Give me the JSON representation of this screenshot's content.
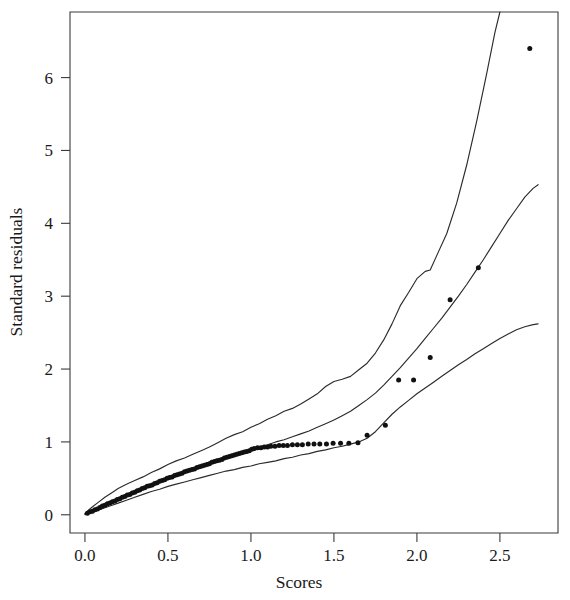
{
  "chart_data": {
    "type": "scatter",
    "title": "",
    "subtitle": "",
    "xlabel": "Scores",
    "ylabel": "Standard residuals",
    "xlim": [
      -0.09,
      2.85
    ],
    "ylim": [
      -0.25,
      6.9
    ],
    "xticks": [
      0.0,
      0.5,
      1.0,
      1.5,
      2.0,
      2.5
    ],
    "xtick_labels": [
      "0.0",
      "0.5",
      "1.0",
      "1.5",
      "2.0",
      "2.5"
    ],
    "yticks": [
      0,
      1,
      2,
      3,
      4,
      5,
      6
    ],
    "ytick_labels": [
      "0",
      "1",
      "2",
      "3",
      "4",
      "5",
      "6"
    ],
    "grid": false,
    "legend": "none",
    "point_color": "#111111",
    "line_color": "#2b2b2b",
    "frame_color": "#3a3a3a",
    "series": [
      {
        "name": "Upper envelope",
        "kind": "line",
        "points": [
          [
            0.0,
            0.02
          ],
          [
            0.04,
            0.1
          ],
          [
            0.08,
            0.17
          ],
          [
            0.12,
            0.24
          ],
          [
            0.16,
            0.3
          ],
          [
            0.2,
            0.36
          ],
          [
            0.25,
            0.42
          ],
          [
            0.3,
            0.47
          ],
          [
            0.35,
            0.52
          ],
          [
            0.4,
            0.58
          ],
          [
            0.45,
            0.63
          ],
          [
            0.5,
            0.69
          ],
          [
            0.55,
            0.74
          ],
          [
            0.6,
            0.78
          ],
          [
            0.65,
            0.83
          ],
          [
            0.7,
            0.88
          ],
          [
            0.75,
            0.93
          ],
          [
            0.8,
            0.99
          ],
          [
            0.85,
            1.05
          ],
          [
            0.9,
            1.1
          ],
          [
            0.95,
            1.14
          ],
          [
            1.0,
            1.2
          ],
          [
            1.05,
            1.25
          ],
          [
            1.1,
            1.31
          ],
          [
            1.15,
            1.36
          ],
          [
            1.2,
            1.42
          ],
          [
            1.25,
            1.46
          ],
          [
            1.3,
            1.52
          ],
          [
            1.35,
            1.59
          ],
          [
            1.4,
            1.66
          ],
          [
            1.45,
            1.76
          ],
          [
            1.5,
            1.83
          ],
          [
            1.55,
            1.86
          ],
          [
            1.6,
            1.9
          ],
          [
            1.65,
            1.99
          ],
          [
            1.7,
            2.08
          ],
          [
            1.75,
            2.22
          ],
          [
            1.8,
            2.4
          ],
          [
            1.85,
            2.62
          ],
          [
            1.9,
            2.87
          ],
          [
            1.95,
            3.05
          ],
          [
            2.0,
            3.24
          ],
          [
            2.05,
            3.34
          ],
          [
            2.08,
            3.36
          ],
          [
            2.12,
            3.56
          ],
          [
            2.18,
            3.86
          ],
          [
            2.24,
            4.28
          ],
          [
            2.3,
            4.8
          ],
          [
            2.36,
            5.4
          ],
          [
            2.42,
            6.05
          ],
          [
            2.47,
            6.62
          ],
          [
            2.5,
            6.9
          ]
        ]
      },
      {
        "name": "Median reference line",
        "kind": "line",
        "points": [
          [
            0.0,
            0.01
          ],
          [
            0.05,
            0.06
          ],
          [
            0.1,
            0.11
          ],
          [
            0.15,
            0.16
          ],
          [
            0.2,
            0.21
          ],
          [
            0.25,
            0.26
          ],
          [
            0.3,
            0.31
          ],
          [
            0.35,
            0.36
          ],
          [
            0.4,
            0.41
          ],
          [
            0.45,
            0.46
          ],
          [
            0.5,
            0.51
          ],
          [
            0.55,
            0.55
          ],
          [
            0.6,
            0.6
          ],
          [
            0.65,
            0.64
          ],
          [
            0.7,
            0.68
          ],
          [
            0.75,
            0.72
          ],
          [
            0.8,
            0.76
          ],
          [
            0.85,
            0.8
          ],
          [
            0.9,
            0.83
          ],
          [
            0.95,
            0.86
          ],
          [
            1.0,
            0.9
          ],
          [
            1.05,
            0.93
          ],
          [
            1.1,
            0.96
          ],
          [
            1.15,
            1.0
          ],
          [
            1.2,
            1.03
          ],
          [
            1.25,
            1.07
          ],
          [
            1.3,
            1.11
          ],
          [
            1.35,
            1.15
          ],
          [
            1.4,
            1.2
          ],
          [
            1.45,
            1.25
          ],
          [
            1.5,
            1.3
          ],
          [
            1.55,
            1.36
          ],
          [
            1.6,
            1.42
          ],
          [
            1.65,
            1.5
          ],
          [
            1.7,
            1.58
          ],
          [
            1.75,
            1.67
          ],
          [
            1.8,
            1.78
          ],
          [
            1.85,
            1.9
          ],
          [
            1.9,
            2.02
          ],
          [
            1.95,
            2.15
          ],
          [
            2.0,
            2.28
          ],
          [
            2.05,
            2.42
          ],
          [
            2.1,
            2.56
          ],
          [
            2.15,
            2.7
          ],
          [
            2.2,
            2.85
          ],
          [
            2.25,
            3.0
          ],
          [
            2.3,
            3.16
          ],
          [
            2.35,
            3.33
          ],
          [
            2.4,
            3.5
          ],
          [
            2.45,
            3.68
          ],
          [
            2.5,
            3.86
          ],
          [
            2.55,
            4.04
          ],
          [
            2.6,
            4.2
          ],
          [
            2.65,
            4.36
          ],
          [
            2.7,
            4.48
          ],
          [
            2.73,
            4.53
          ]
        ]
      },
      {
        "name": "Lower envelope",
        "kind": "line",
        "points": [
          [
            0.0,
            0.0
          ],
          [
            0.05,
            0.04
          ],
          [
            0.1,
            0.08
          ],
          [
            0.15,
            0.12
          ],
          [
            0.2,
            0.16
          ],
          [
            0.25,
            0.2
          ],
          [
            0.3,
            0.24
          ],
          [
            0.35,
            0.28
          ],
          [
            0.4,
            0.32
          ],
          [
            0.45,
            0.35
          ],
          [
            0.5,
            0.39
          ],
          [
            0.55,
            0.42
          ],
          [
            0.6,
            0.45
          ],
          [
            0.65,
            0.48
          ],
          [
            0.7,
            0.51
          ],
          [
            0.75,
            0.54
          ],
          [
            0.8,
            0.57
          ],
          [
            0.85,
            0.6
          ],
          [
            0.9,
            0.62
          ],
          [
            0.95,
            0.65
          ],
          [
            1.0,
            0.67
          ],
          [
            1.05,
            0.7
          ],
          [
            1.1,
            0.72
          ],
          [
            1.15,
            0.74
          ],
          [
            1.2,
            0.77
          ],
          [
            1.25,
            0.79
          ],
          [
            1.3,
            0.82
          ],
          [
            1.35,
            0.84
          ],
          [
            1.4,
            0.87
          ],
          [
            1.45,
            0.89
          ],
          [
            1.5,
            0.92
          ],
          [
            1.55,
            0.94
          ],
          [
            1.6,
            0.97
          ],
          [
            1.65,
            1.0
          ],
          [
            1.7,
            1.05
          ],
          [
            1.75,
            1.14
          ],
          [
            1.8,
            1.26
          ],
          [
            1.85,
            1.38
          ],
          [
            1.9,
            1.48
          ],
          [
            1.95,
            1.57
          ],
          [
            2.0,
            1.66
          ],
          [
            2.05,
            1.74
          ],
          [
            2.1,
            1.82
          ],
          [
            2.15,
            1.9
          ],
          [
            2.2,
            1.98
          ],
          [
            2.25,
            2.06
          ],
          [
            2.3,
            2.13
          ],
          [
            2.35,
            2.21
          ],
          [
            2.4,
            2.28
          ],
          [
            2.45,
            2.35
          ],
          [
            2.5,
            2.42
          ],
          [
            2.55,
            2.48
          ],
          [
            2.6,
            2.54
          ],
          [
            2.65,
            2.58
          ],
          [
            2.7,
            2.61
          ],
          [
            2.73,
            2.62
          ]
        ]
      },
      {
        "name": "Standard residuals",
        "kind": "scatter",
        "points": [
          [
            0.015,
            0.02
          ],
          [
            0.03,
            0.04
          ],
          [
            0.045,
            0.05
          ],
          [
            0.06,
            0.07
          ],
          [
            0.075,
            0.08
          ],
          [
            0.09,
            0.1
          ],
          [
            0.105,
            0.12
          ],
          [
            0.12,
            0.13
          ],
          [
            0.135,
            0.15
          ],
          [
            0.15,
            0.16
          ],
          [
            0.165,
            0.18
          ],
          [
            0.18,
            0.19
          ],
          [
            0.195,
            0.21
          ],
          [
            0.21,
            0.22
          ],
          [
            0.225,
            0.24
          ],
          [
            0.24,
            0.25
          ],
          [
            0.255,
            0.27
          ],
          [
            0.27,
            0.28
          ],
          [
            0.285,
            0.3
          ],
          [
            0.3,
            0.31
          ],
          [
            0.315,
            0.33
          ],
          [
            0.33,
            0.34
          ],
          [
            0.345,
            0.36
          ],
          [
            0.36,
            0.37
          ],
          [
            0.375,
            0.39
          ],
          [
            0.39,
            0.4
          ],
          [
            0.405,
            0.41
          ],
          [
            0.42,
            0.43
          ],
          [
            0.435,
            0.44
          ],
          [
            0.45,
            0.46
          ],
          [
            0.465,
            0.47
          ],
          [
            0.48,
            0.48
          ],
          [
            0.495,
            0.5
          ],
          [
            0.51,
            0.51
          ],
          [
            0.525,
            0.52
          ],
          [
            0.54,
            0.54
          ],
          [
            0.555,
            0.55
          ],
          [
            0.57,
            0.56
          ],
          [
            0.585,
            0.57
          ],
          [
            0.6,
            0.59
          ],
          [
            0.615,
            0.6
          ],
          [
            0.63,
            0.61
          ],
          [
            0.645,
            0.62
          ],
          [
            0.66,
            0.63
          ],
          [
            0.675,
            0.65
          ],
          [
            0.69,
            0.66
          ],
          [
            0.705,
            0.67
          ],
          [
            0.72,
            0.68
          ],
          [
            0.735,
            0.69
          ],
          [
            0.75,
            0.7
          ],
          [
            0.765,
            0.72
          ],
          [
            0.78,
            0.73
          ],
          [
            0.795,
            0.74
          ],
          [
            0.81,
            0.75
          ],
          [
            0.825,
            0.76
          ],
          [
            0.84,
            0.78
          ],
          [
            0.855,
            0.79
          ],
          [
            0.87,
            0.8
          ],
          [
            0.885,
            0.81
          ],
          [
            0.9,
            0.82
          ],
          [
            0.915,
            0.83
          ],
          [
            0.93,
            0.84
          ],
          [
            0.945,
            0.85
          ],
          [
            0.96,
            0.86
          ],
          [
            0.975,
            0.87
          ],
          [
            0.99,
            0.88
          ],
          [
            1.005,
            0.9
          ],
          [
            1.02,
            0.91
          ],
          [
            1.04,
            0.92
          ],
          [
            1.06,
            0.92
          ],
          [
            1.08,
            0.93
          ],
          [
            1.1,
            0.93
          ],
          [
            1.12,
            0.94
          ],
          [
            1.145,
            0.94
          ],
          [
            1.17,
            0.95
          ],
          [
            1.195,
            0.95
          ],
          [
            1.22,
            0.95
          ],
          [
            1.25,
            0.96
          ],
          [
            1.28,
            0.96
          ],
          [
            1.31,
            0.96
          ],
          [
            1.345,
            0.97
          ],
          [
            1.38,
            0.97
          ],
          [
            1.415,
            0.97
          ],
          [
            1.455,
            0.97
          ],
          [
            1.495,
            0.98
          ],
          [
            1.54,
            0.98
          ],
          [
            1.59,
            0.98
          ],
          [
            1.645,
            0.99
          ],
          [
            1.7,
            1.09
          ],
          [
            1.81,
            1.23
          ],
          [
            1.89,
            1.85
          ],
          [
            1.98,
            1.85
          ],
          [
            2.08,
            2.16
          ],
          [
            2.2,
            2.95
          ],
          [
            2.37,
            3.39
          ],
          [
            2.68,
            6.4
          ]
        ]
      }
    ]
  }
}
